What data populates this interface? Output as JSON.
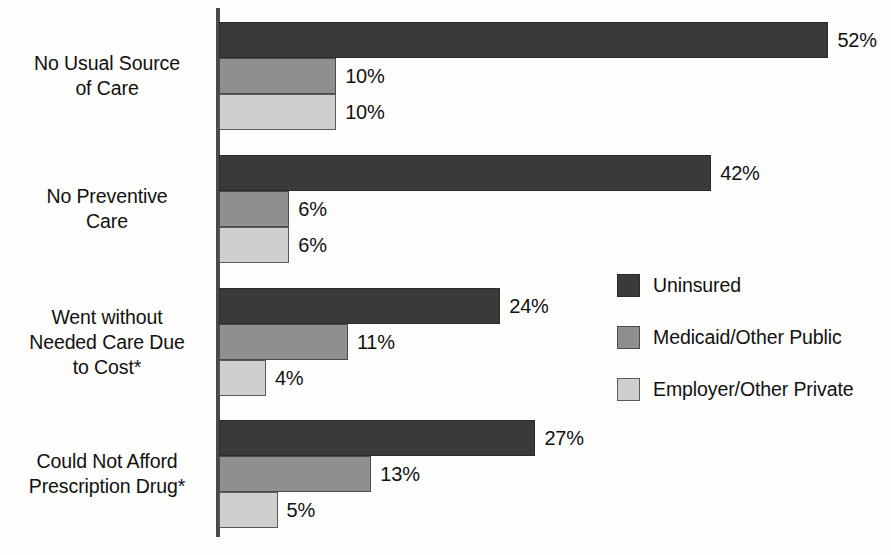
{
  "chart_data": {
    "type": "bar",
    "orientation": "horizontal",
    "title": "",
    "subtitle": "",
    "xlabel": "",
    "ylabel": "",
    "xlim": [
      0,
      57
    ],
    "grid": false,
    "value_suffix": "%",
    "legend_position": "middle-right",
    "categories": [
      "No Usual Source\nof Care",
      "No Preventive\nCare",
      "Went without\nNeeded Care Due\nto Cost*",
      "Could Not Afford\nPrescription Drug*"
    ],
    "series": [
      {
        "name": "Uninsured",
        "color": "#3b3a38",
        "values": [
          52,
          42,
          24,
          27
        ],
        "labels": [
          "52%",
          "42%",
          "24%",
          "27%"
        ]
      },
      {
        "name": "Medicaid/Other Public",
        "color": "#8f8f8d",
        "values": [
          10,
          6,
          11,
          13
        ],
        "labels": [
          "10%",
          "6%",
          "11%",
          "13%"
        ]
      },
      {
        "name": "Employer/Other Private",
        "color": "#cfcfcd",
        "values": [
          10,
          6,
          4,
          5
        ],
        "labels": [
          "10%",
          "6%",
          "4%",
          "5%"
        ]
      }
    ],
    "annotations": []
  },
  "legend": {
    "items": [
      {
        "label": "Uninsured",
        "swatch": "dark-swatch"
      },
      {
        "label": "Medicaid/Other Public",
        "swatch": "medium-swatch"
      },
      {
        "label": "Employer/Other Private",
        "swatch": "light-swatch"
      }
    ]
  },
  "colors": {
    "uninsured": "#3b3a38",
    "medicaid_other_public": "#8f8f8d",
    "employer_other_private": "#cfcfcd",
    "axis": "#4a4a4a",
    "text": "#111111",
    "background": "#fdfdfc"
  },
  "layout": {
    "axis_x": 219,
    "px_per_percent": 11.72,
    "bar_height": 36,
    "group_tops": [
      22,
      155,
      288,
      420
    ]
  }
}
